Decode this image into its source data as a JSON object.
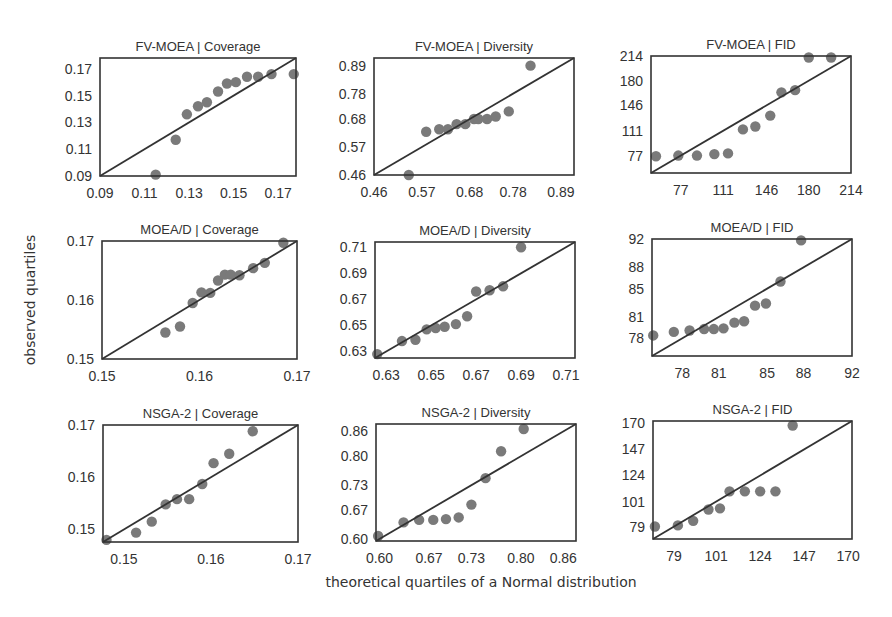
{
  "figure": {
    "ylabel": "observed quartiles",
    "xlabel": "theoretical quartiles of a Normal distribution"
  },
  "style": {
    "point_color": "#7a7a7a",
    "line_color": "#333333",
    "frame_color": "#333333",
    "text_color": "#333333"
  },
  "chart_data": [
    {
      "type": "scatter",
      "title": "FV-MOEA | Coverage",
      "frame": [
        100,
        58,
        296,
        176
      ],
      "range": [
        0.09,
        0.178
      ],
      "xticks": [
        {
          "v": 0.09,
          "l": "0.09"
        },
        {
          "v": 0.11,
          "l": "0.11"
        },
        {
          "v": 0.13,
          "l": "0.13"
        },
        {
          "v": 0.15,
          "l": "0.15"
        },
        {
          "v": 0.17,
          "l": "0.17"
        }
      ],
      "yticks": [
        {
          "v": 0.09,
          "l": "0.09"
        },
        {
          "v": 0.11,
          "l": "0.11"
        },
        {
          "v": 0.13,
          "l": "0.13"
        },
        {
          "v": 0.15,
          "l": "0.15"
        },
        {
          "v": 0.17,
          "l": "0.17"
        }
      ],
      "points": [
        [
          0.115,
          0.091
        ],
        [
          0.124,
          0.117
        ],
        [
          0.129,
          0.136
        ],
        [
          0.134,
          0.142
        ],
        [
          0.138,
          0.145
        ],
        [
          0.143,
          0.153
        ],
        [
          0.147,
          0.159
        ],
        [
          0.151,
          0.16
        ],
        [
          0.156,
          0.164
        ],
        [
          0.161,
          0.164
        ],
        [
          0.167,
          0.166
        ],
        [
          0.177,
          0.166
        ]
      ]
    },
    {
      "type": "scatter",
      "title": "FV-MOEA | Diversity",
      "frame": [
        374,
        58,
        574,
        175
      ],
      "range": [
        0.46,
        0.92
      ],
      "xticks": [
        {
          "v": 0.46,
          "l": "0.46"
        },
        {
          "v": 0.57,
          "l": "0.57"
        },
        {
          "v": 0.68,
          "l": "0.68"
        },
        {
          "v": 0.78,
          "l": "0.78"
        },
        {
          "v": 0.89,
          "l": "0.89"
        }
      ],
      "yticks": [
        {
          "v": 0.46,
          "l": "0.46"
        },
        {
          "v": 0.57,
          "l": "0.57"
        },
        {
          "v": 0.68,
          "l": "0.68"
        },
        {
          "v": 0.78,
          "l": "0.78"
        },
        {
          "v": 0.89,
          "l": "0.89"
        }
      ],
      "points": [
        [
          0.54,
          0.46
        ],
        [
          0.58,
          0.63
        ],
        [
          0.61,
          0.64
        ],
        [
          0.63,
          0.64
        ],
        [
          0.65,
          0.66
        ],
        [
          0.67,
          0.66
        ],
        [
          0.69,
          0.68
        ],
        [
          0.7,
          0.68
        ],
        [
          0.72,
          0.68
        ],
        [
          0.74,
          0.69
        ],
        [
          0.77,
          0.71
        ],
        [
          0.82,
          0.89
        ]
      ]
    },
    {
      "type": "scatter",
      "title": "FV-MOEA | FID",
      "frame": [
        651,
        56,
        851,
        173
      ],
      "range": [
        53,
        214
      ],
      "xticks": [
        {
          "v": 77,
          "l": "77"
        },
        {
          "v": 111,
          "l": "111"
        },
        {
          "v": 146,
          "l": "146"
        },
        {
          "v": 180,
          "l": "180"
        },
        {
          "v": 214,
          "l": "214"
        }
      ],
      "yticks": [
        {
          "v": 77,
          "l": "77"
        },
        {
          "v": 111,
          "l": "111"
        },
        {
          "v": 146,
          "l": "146"
        },
        {
          "v": 180,
          "l": "180"
        },
        {
          "v": 214,
          "l": "214"
        }
      ],
      "points": [
        [
          57,
          76
        ],
        [
          75,
          77
        ],
        [
          90,
          77
        ],
        [
          104,
          79
        ],
        [
          115,
          80
        ],
        [
          127,
          113
        ],
        [
          137,
          117
        ],
        [
          149,
          132
        ],
        [
          158,
          164
        ],
        [
          169,
          167
        ],
        [
          180,
          212
        ],
        [
          198,
          212
        ]
      ]
    },
    {
      "type": "scatter",
      "title": "MOEA/D | Coverage",
      "frame": [
        102,
        241,
        297,
        359
      ],
      "range": [
        0.15,
        0.17
      ],
      "xticks": [
        {
          "v": 0.15,
          "l": "0.15"
        },
        {
          "v": 0.16,
          "l": "0.16"
        },
        {
          "v": 0.17,
          "l": "0.17"
        }
      ],
      "yticks": [
        {
          "v": 0.15,
          "l": "0.15"
        },
        {
          "v": 0.16,
          "l": "0.16"
        },
        {
          "v": 0.17,
          "l": "0.17"
        }
      ],
      "points": [
        [
          0.1565,
          0.1545
        ],
        [
          0.158,
          0.1555
        ],
        [
          0.1593,
          0.1595
        ],
        [
          0.1602,
          0.1613
        ],
        [
          0.1611,
          0.1612
        ],
        [
          0.1619,
          0.1633
        ],
        [
          0.1626,
          0.1643
        ],
        [
          0.1632,
          0.1643
        ],
        [
          0.1641,
          0.1642
        ],
        [
          0.1655,
          0.1654
        ],
        [
          0.1667,
          0.1663
        ],
        [
          0.1686,
          0.1697
        ]
      ]
    },
    {
      "type": "scatter",
      "title": "MOEA/D | Diversity",
      "frame": [
        375,
        242,
        575,
        358
      ],
      "range": [
        0.625,
        0.714
      ],
      "xticks": [
        {
          "v": 0.63,
          "l": "0.63"
        },
        {
          "v": 0.65,
          "l": "0.65"
        },
        {
          "v": 0.67,
          "l": "0.67"
        },
        {
          "v": 0.69,
          "l": "0.69"
        },
        {
          "v": 0.71,
          "l": "0.71"
        }
      ],
      "yticks": [
        {
          "v": 0.63,
          "l": "0.63"
        },
        {
          "v": 0.65,
          "l": "0.65"
        },
        {
          "v": 0.67,
          "l": "0.67"
        },
        {
          "v": 0.69,
          "l": "0.69"
        },
        {
          "v": 0.71,
          "l": "0.71"
        }
      ],
      "points": [
        [
          0.626,
          0.628
        ],
        [
          0.637,
          0.638
        ],
        [
          0.643,
          0.639
        ],
        [
          0.648,
          0.647
        ],
        [
          0.652,
          0.648
        ],
        [
          0.656,
          0.649
        ],
        [
          0.661,
          0.651
        ],
        [
          0.666,
          0.657
        ],
        [
          0.67,
          0.676
        ],
        [
          0.676,
          0.677
        ],
        [
          0.682,
          0.68
        ],
        [
          0.69,
          0.71
        ]
      ]
    },
    {
      "type": "scatter",
      "title": "MOEA/D | FID",
      "frame": [
        652,
        239,
        852,
        356
      ],
      "range": [
        75.5,
        92
      ],
      "xticks": [
        {
          "v": 78,
          "l": "78"
        },
        {
          "v": 81,
          "l": "81"
        },
        {
          "v": 85,
          "l": "85"
        },
        {
          "v": 88,
          "l": "88"
        },
        {
          "v": 92,
          "l": "92"
        }
      ],
      "yticks": [
        {
          "v": 78,
          "l": "78"
        },
        {
          "v": 81,
          "l": "81"
        },
        {
          "v": 85,
          "l": "85"
        },
        {
          "v": 88,
          "l": "88"
        },
        {
          "v": 92,
          "l": "92"
        }
      ],
      "points": [
        [
          75.6,
          78.4
        ],
        [
          77.3,
          78.9
        ],
        [
          78.6,
          79.1
        ],
        [
          79.8,
          79.3
        ],
        [
          80.6,
          79.3
        ],
        [
          81.4,
          79.4
        ],
        [
          82.3,
          80.2
        ],
        [
          83.1,
          80.4
        ],
        [
          84.0,
          82.6
        ],
        [
          84.9,
          82.9
        ],
        [
          86.1,
          86.0
        ],
        [
          87.8,
          91.8
        ]
      ]
    },
    {
      "type": "scatter",
      "title": "NSGA-2 | Coverage",
      "frame": [
        103,
        425,
        298,
        542
      ],
      "range": [
        0.1476,
        0.17
      ],
      "xticks": [
        {
          "v": 0.15,
          "l": "0.15"
        },
        {
          "v": 0.16,
          "l": "0.16"
        },
        {
          "v": 0.17,
          "l": "0.17"
        }
      ],
      "yticks": [
        {
          "v": 0.15,
          "l": "0.15"
        },
        {
          "v": 0.16,
          "l": "0.16"
        },
        {
          "v": 0.17,
          "l": "0.17"
        }
      ],
      "points": [
        [
          0.148,
          0.148
        ],
        [
          0.1514,
          0.1494
        ],
        [
          0.1532,
          0.1515
        ],
        [
          0.1548,
          0.1548
        ],
        [
          0.1561,
          0.1558
        ],
        [
          0.1575,
          0.1558
        ],
        [
          0.159,
          0.1587
        ],
        [
          0.1603,
          0.1627
        ],
        [
          0.1621,
          0.1645
        ],
        [
          0.1648,
          0.1688
        ]
      ]
    },
    {
      "type": "scatter",
      "title": "NSGA-2 | Diversity",
      "frame": [
        376,
        424,
        576,
        541
      ],
      "range": [
        0.595,
        0.878
      ],
      "xticks": [
        {
          "v": 0.6,
          "l": "0.60"
        },
        {
          "v": 0.67,
          "l": "0.67"
        },
        {
          "v": 0.73,
          "l": "0.73"
        },
        {
          "v": 0.8,
          "l": "0.80"
        },
        {
          "v": 0.86,
          "l": "0.86"
        }
      ],
      "yticks": [
        {
          "v": 0.6,
          "l": "0.60"
        },
        {
          "v": 0.67,
          "l": "0.67"
        },
        {
          "v": 0.73,
          "l": "0.73"
        },
        {
          "v": 0.8,
          "l": "0.80"
        },
        {
          "v": 0.86,
          "l": "0.86"
        }
      ],
      "points": [
        [
          0.598,
          0.607
        ],
        [
          0.634,
          0.64
        ],
        [
          0.656,
          0.646
        ],
        [
          0.676,
          0.646
        ],
        [
          0.694,
          0.648
        ],
        [
          0.712,
          0.652
        ],
        [
          0.73,
          0.683
        ],
        [
          0.75,
          0.747
        ],
        [
          0.772,
          0.812
        ],
        [
          0.804,
          0.866
        ]
      ]
    },
    {
      "type": "scatter",
      "title": "NSGA-2 | FID",
      "frame": [
        653,
        421,
        852,
        539
      ],
      "range": [
        68,
        172
      ],
      "xticks": [
        {
          "v": 79,
          "l": "79"
        },
        {
          "v": 101,
          "l": "101"
        },
        {
          "v": 124,
          "l": "124"
        },
        {
          "v": 147,
          "l": "147"
        },
        {
          "v": 170,
          "l": "170"
        }
      ],
      "yticks": [
        {
          "v": 79,
          "l": "79"
        },
        {
          "v": 101,
          "l": "101"
        },
        {
          "v": 124,
          "l": "124"
        },
        {
          "v": 147,
          "l": "147"
        },
        {
          "v": 170,
          "l": "170"
        }
      ],
      "points": [
        [
          69,
          79
        ],
        [
          81,
          80
        ],
        [
          89,
          84
        ],
        [
          97,
          94
        ],
        [
          103,
          95
        ],
        [
          108,
          110
        ],
        [
          116,
          110
        ],
        [
          124,
          110
        ],
        [
          132,
          110
        ],
        [
          141,
          168
        ]
      ]
    }
  ]
}
